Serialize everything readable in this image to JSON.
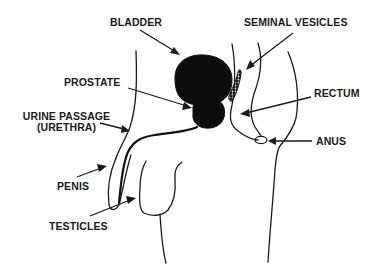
{
  "diagram": {
    "type": "anatomical-cross-section",
    "colors": {
      "ink": "#1a1a1a",
      "organ_fill": "#0d0d0d",
      "background": "#ffffff"
    },
    "labels": {
      "bladder": "BLADDER",
      "seminal_vesicles": "SEMINAL VESICLES",
      "prostate": "PROSTATE",
      "rectum": "RECTUM",
      "urethra_line1": "URINE PASSAGE",
      "urethra_line2": "(URETHRA)",
      "anus": "ANUS",
      "penis": "PENIS",
      "testicles": "TESTICLES"
    }
  }
}
